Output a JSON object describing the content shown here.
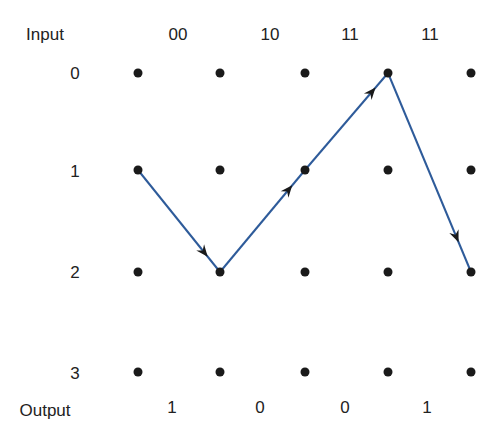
{
  "diagram": {
    "type": "trellis",
    "header_label": "Input",
    "footer_label": "Output",
    "inputs": [
      "00",
      "10",
      "11",
      "11"
    ],
    "outputs": [
      "1",
      "0",
      "0",
      "1"
    ],
    "states": [
      "0",
      "1",
      "2",
      "3"
    ],
    "columns": 5,
    "path": [
      {
        "from": {
          "col": 0,
          "state": 1
        },
        "to": {
          "col": 1,
          "state": 2
        }
      },
      {
        "from": {
          "col": 1,
          "state": 2
        },
        "to": {
          "col": 2,
          "state": 1
        }
      },
      {
        "from": {
          "col": 2,
          "state": 1
        },
        "to": {
          "col": 3,
          "state": 0
        }
      },
      {
        "from": {
          "col": 3,
          "state": 0
        },
        "to": {
          "col": 4,
          "state": 2
        }
      }
    ],
    "path_color": "#2e5b9a",
    "node_color": "#1a1a1a"
  }
}
